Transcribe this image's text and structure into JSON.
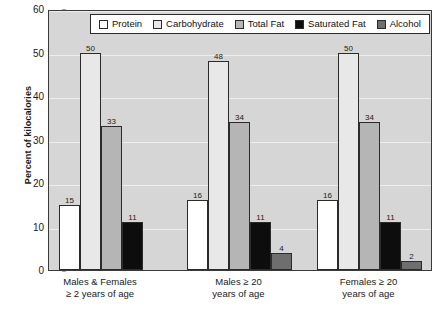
{
  "chart_data": {
    "type": "bar",
    "title": "",
    "xlabel": "",
    "ylabel": "Percent of kilocalories",
    "ylim": [
      0,
      60
    ],
    "yticks": [
      0,
      10,
      20,
      30,
      40,
      50,
      60
    ],
    "grid": true,
    "legend_position": "top-inside",
    "categories": [
      "Males & Females\n≥ 2 years of age",
      "Males ≥ 20\nyears of age",
      "Females ≥ 20\nyears of age"
    ],
    "series": [
      {
        "name": "Protein",
        "color": "#ffffff",
        "values": [
          15,
          16,
          16
        ]
      },
      {
        "name": "Carbohydrate",
        "color": "#e8e8e8",
        "values": [
          50,
          48,
          50
        ]
      },
      {
        "name": "Total Fat",
        "color": "#b5b5b5",
        "values": [
          33,
          34,
          34
        ]
      },
      {
        "name": "Saturated Fat",
        "color": "#0d0d0d",
        "values": [
          11,
          11,
          11
        ]
      },
      {
        "name": "Alcohol",
        "color": "#6e6e6e",
        "values": [
          null,
          4,
          2
        ]
      }
    ]
  },
  "axis": {
    "y_title": "Percent of kilocalories",
    "y_tick_labels": [
      "0",
      "10",
      "20",
      "30",
      "40",
      "50",
      "60"
    ]
  },
  "legend": {
    "items": [
      {
        "label": "Protein"
      },
      {
        "label": "Carbohydrate"
      },
      {
        "label": "Total Fat"
      },
      {
        "label": "Saturated Fat"
      },
      {
        "label": "Alcohol"
      }
    ]
  },
  "x_axis": {
    "groups": [
      {
        "line1": "Males & Females",
        "line2": "≥ 2 years of age"
      },
      {
        "line1": "Males ≥ 20",
        "line2": "years of age"
      },
      {
        "line1": "Females ≥ 20",
        "line2": "years of age"
      }
    ]
  },
  "bar_labels": {
    "g0": [
      "15",
      "50",
      "33",
      "11"
    ],
    "g1": [
      "16",
      "48",
      "34",
      "11",
      "4"
    ],
    "g2": [
      "16",
      "50",
      "34",
      "11",
      "2"
    ]
  },
  "colors": {
    "plot_background": "#d6d6d6",
    "gridline": "#ededed",
    "frame": "#3a3a3a",
    "bar_outline": "#2b2b2b",
    "text": "#1a1a1a"
  }
}
